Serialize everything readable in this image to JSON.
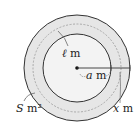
{
  "diagram": {
    "type": "concentric-circles",
    "colors": {
      "stroke": "#333333",
      "ring_fill": "#e6e6e6",
      "inner_fill": "#f3f3f3",
      "dashed": "#999999",
      "background": "#ffffff"
    },
    "labels": {
      "ell": {
        "sym": "ℓ",
        "unit": " m"
      },
      "a": {
        "sym": "a",
        "unit": " m"
      },
      "x": {
        "sym": "x",
        "unit": " m"
      },
      "S": {
        "sym": "S",
        "unit": " m²"
      }
    }
  }
}
